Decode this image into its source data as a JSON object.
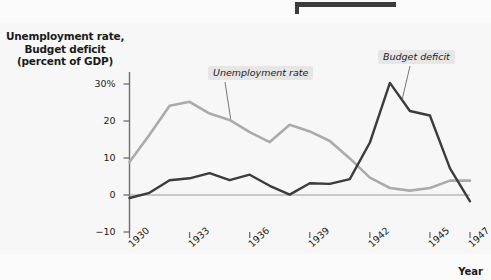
{
  "figure": {
    "top_rule": "decorative-rule",
    "x_axis_name": "Year",
    "y_axis_title_lines": [
      "Unemployment rate,",
      "Budget deficit",
      "(percent of GDP)"
    ]
  },
  "colors": {
    "unemployment": "#ababab",
    "deficit": "#3c3c3c",
    "axis": "#6e6e6e",
    "zero_line": "#9a9a9a",
    "page_background": "#f7f7f7",
    "label_background": "#e6e6e6",
    "text": "#1b1b1b"
  },
  "chart_data": {
    "type": "line",
    "title": "",
    "xlabel": "Year",
    "ylabel": "Unemployment rate, Budget deficit (percent of GDP)",
    "xlim": [
      1930,
      1947
    ],
    "ylim": [
      -10,
      33
    ],
    "yticks": [
      30,
      20,
      10,
      0,
      -10
    ],
    "ytick_labels": [
      "30%",
      "20",
      "10",
      "0",
      "−10"
    ],
    "xticks": [
      1930,
      1933,
      1936,
      1939,
      1942,
      1945,
      1947
    ],
    "xtick_labels": [
      "1930",
      "1933",
      "1936",
      "1939",
      "1942",
      "1945",
      "1947"
    ],
    "grid": false,
    "legend": "inline-annotations",
    "x": [
      1930,
      1931,
      1932,
      1933,
      1934,
      1935,
      1936,
      1937,
      1938,
      1939,
      1940,
      1941,
      1942,
      1943,
      1944,
      1945,
      1946,
      1947
    ],
    "series": [
      {
        "name": "Unemployment rate",
        "color": "#ababab",
        "label_position": "above-line-1935",
        "values": [
          8.9,
          16.3,
          24.1,
          25.2,
          22.0,
          20.3,
          17.0,
          14.3,
          19.0,
          17.2,
          14.6,
          9.9,
          4.7,
          1.9,
          1.2,
          1.9,
          3.9,
          3.9
        ]
      },
      {
        "name": "Budget deficit",
        "color": "#3c3c3c",
        "label_position": "above-line-1943",
        "values": [
          -0.8,
          0.6,
          4.0,
          4.5,
          5.9,
          4.0,
          5.5,
          2.5,
          0.1,
          3.2,
          3.0,
          4.3,
          14.2,
          30.3,
          22.7,
          21.5,
          7.2,
          -1.7
        ]
      }
    ],
    "annotations": [
      {
        "text": "Unemployment rate",
        "target_x": 1935,
        "target_y": 20.3
      },
      {
        "text": "Budget deficit",
        "target_x": 1943.6,
        "target_y": 26.0
      }
    ]
  }
}
